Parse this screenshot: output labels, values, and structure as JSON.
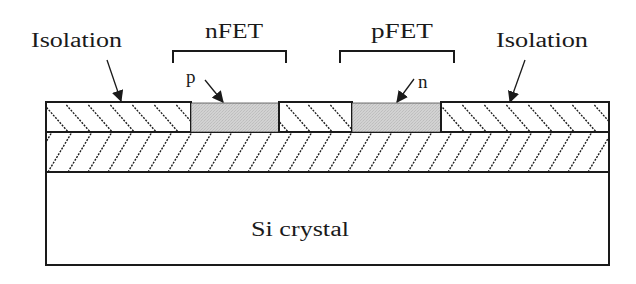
{
  "figure": {
    "type": "semiconductor-cross-section",
    "labels": {
      "isolation_left": "Isolation",
      "isolation_right": "Isolation",
      "nfet": "nFET",
      "pfet": "pFET",
      "p_region": "p",
      "n_region": "n",
      "substrate": "Si crystal"
    },
    "layers": [
      {
        "name": "top-layer",
        "description": "isolation with p and n active regions",
        "hatch": "backslash"
      },
      {
        "name": "buried-layer",
        "hatch": "slash"
      },
      {
        "name": "substrate",
        "label": "Si crystal",
        "fill": "#ffffff"
      }
    ],
    "colors": {
      "stroke": "#1a1a1a",
      "active_region_fill": "#cdcdcd",
      "background": "#ffffff"
    }
  }
}
